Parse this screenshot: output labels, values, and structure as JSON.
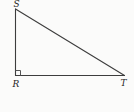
{
  "figure": {
    "type": "geometry-diagram",
    "background_color": "#fbfbfa",
    "stroke_color": "#3d3d3d",
    "label_color": "#1f1f1f",
    "labels": {
      "top": "S",
      "bottom_left": "R",
      "bottom_right": "T"
    },
    "vertices": [
      {
        "name": "S",
        "x": 15.5,
        "y": 9
      },
      {
        "name": "R",
        "x": 15.5,
        "y": 75.5
      },
      {
        "name": "T",
        "x": 124.5,
        "y": 75.5
      }
    ],
    "right_angle_at": "R",
    "right_angle_marker_size": 5
  }
}
